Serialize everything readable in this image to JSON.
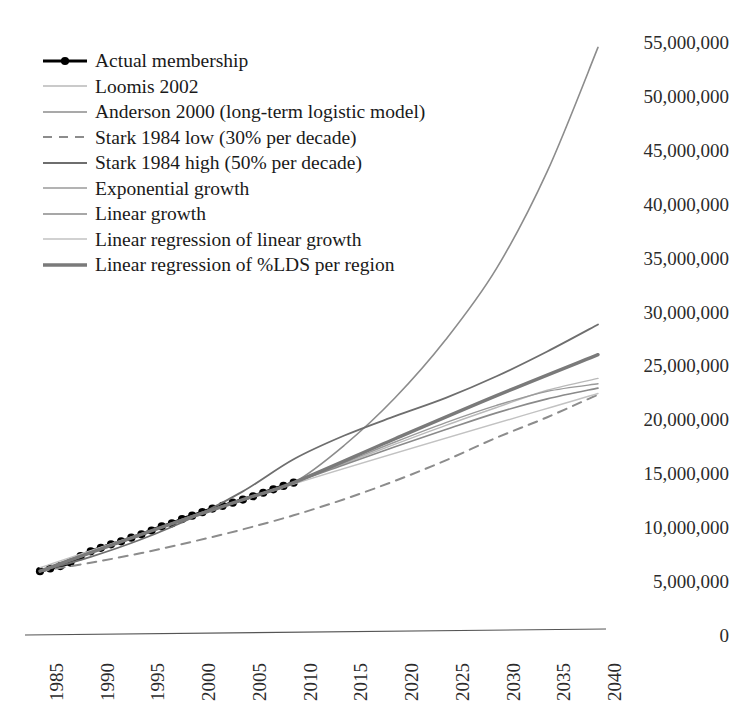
{
  "chart_data": {
    "type": "line",
    "title": "",
    "subtitle": "",
    "xlabel": "",
    "ylabel": "",
    "xlim": [
      1985,
      2040
    ],
    "ylim": [
      0,
      55000000
    ],
    "grid": false,
    "legend_position": "top-left",
    "x_ticks": [
      "1985",
      "1990",
      "1995",
      "2000",
      "2005",
      "2010",
      "2015",
      "2020",
      "2025",
      "2030",
      "2035",
      "2040"
    ],
    "y_ticks": [
      "0",
      "5,000,000",
      "10,000,000",
      "15,000,000",
      "20,000,000",
      "25,000,000",
      "30,000,000",
      "35,000,000",
      "40,000,000",
      "45,000,000",
      "50,000,000",
      "55,000,000"
    ],
    "series": [
      {
        "name": "Actual membership",
        "style": "solid-markers",
        "color": "#000000",
        "width": 3.2,
        "marker": "circle",
        "x": [
          1985,
          1986,
          1987,
          1988,
          1989,
          1990,
          1991,
          1992,
          1993,
          1994,
          1995,
          1996,
          1997,
          1998,
          1999,
          2000,
          2001,
          2002,
          2003,
          2004,
          2005,
          2006,
          2007,
          2008,
          2009,
          2010
        ],
        "values": [
          5919483,
          6166000,
          6394314,
          6721000,
          7308000,
          7761000,
          8089000,
          8406000,
          8689000,
          9025000,
          9340000,
          9693000,
          10070500,
          10354241,
          10752986,
          11068861,
          11394522,
          11721548,
          11985254,
          12275822,
          12560869,
          12868606,
          13193999,
          13508509,
          13824854,
          14131467
        ]
      },
      {
        "name": "Loomis 2002",
        "style": "solid",
        "color": "#b9b9b9",
        "width": 1.4,
        "x": [
          1985,
          1995,
          2005,
          2010,
          2015,
          2020,
          2025,
          2030,
          2035,
          2040
        ],
        "values": [
          5919483,
          9340000,
          12560869,
          14131467,
          15900000,
          17700000,
          19450000,
          21100000,
          22700000,
          23800000
        ]
      },
      {
        "name": "Anderson 2000 (long-term logistic model)",
        "style": "solid",
        "color": "#8c8c8c",
        "width": 1.6,
        "x": [
          1985,
          1990,
          1995,
          2000,
          2005,
          2010,
          2015,
          2020,
          2025,
          2030,
          2035,
          2040
        ],
        "values": [
          5919483,
          7761000,
          9340000,
          11068861,
          12560869,
          14131467,
          17600000,
          22000000,
          27400000,
          34000000,
          43000000,
          54500000
        ]
      },
      {
        "name": "Stark 1984 low (30% per decade)",
        "style": "dashed",
        "color": "#8c8c8c",
        "width": 2.0,
        "x": [
          1985,
          1990,
          1995,
          2000,
          2005,
          2010,
          2015,
          2020,
          2025,
          2030,
          2035,
          2040
        ],
        "values": [
          5919483,
          6700000,
          7600000,
          8650000,
          9800000,
          11100000,
          12600000,
          14300000,
          16200000,
          18300000,
          20200000,
          22300000
        ]
      },
      {
        "name": "Stark 1984 high (50% per decade)",
        "style": "solid",
        "color": "#6e6e6e",
        "width": 1.8,
        "x": [
          1985,
          1990,
          1995,
          2000,
          2005,
          2010,
          2015,
          2020,
          2025,
          2030,
          2035,
          2040
        ],
        "values": [
          5919483,
          7250000,
          8880000,
          10880000,
          13320000,
          16300000,
          18500000,
          20300000,
          22000000,
          24000000,
          26300000,
          28800000
        ]
      },
      {
        "name": "Exponential growth",
        "style": "solid",
        "color": "#9a9a9a",
        "width": 1.4,
        "x": [
          1985,
          1995,
          2005,
          2010,
          2015,
          2020,
          2025,
          2030,
          2035,
          2040
        ],
        "values": [
          5919483,
          9340000,
          12560869,
          14131467,
          16000000,
          17900000,
          19700000,
          21300000,
          22600000,
          23300000
        ]
      },
      {
        "name": "Linear growth",
        "style": "solid",
        "color": "#8a8a8a",
        "width": 1.6,
        "x": [
          1985,
          1995,
          2005,
          2010,
          2015,
          2020,
          2025,
          2030,
          2035,
          2040
        ],
        "values": [
          5919483,
          9340000,
          12560869,
          14131467,
          15800000,
          17450000,
          19050000,
          20600000,
          21900000,
          22900000
        ]
      },
      {
        "name": "Linear regression of linear growth",
        "style": "solid",
        "color": "#c2c2c2",
        "width": 1.4,
        "x": [
          1985,
          2010,
          2040
        ],
        "values": [
          6250000,
          14000000,
          22400000
        ]
      },
      {
        "name": "Linear regression of %LDS per region",
        "style": "solid",
        "color": "#7a7a7a",
        "width": 3.4,
        "x": [
          1985,
          1995,
          2005,
          2010,
          2020,
          2030,
          2040
        ],
        "values": [
          5919483,
          9340000,
          12560869,
          14131467,
          18200000,
          22200000,
          26000000
        ]
      }
    ]
  },
  "axis": {
    "x_axis_line": true,
    "y_axis_line": false
  }
}
